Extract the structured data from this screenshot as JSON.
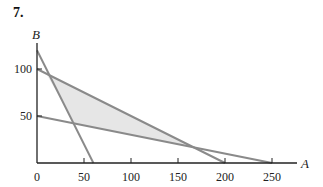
{
  "problem_number": "7.",
  "colors": {
    "line": "#8a8a8a",
    "fill": "#e6e6e6",
    "axis": "#222222"
  },
  "chart_data": {
    "type": "line",
    "title": "",
    "xlabel": "A",
    "ylabel": "B",
    "xlim": [
      0,
      275
    ],
    "ylim": [
      0,
      130
    ],
    "x_ticks": [
      0,
      50,
      100,
      150,
      200,
      250
    ],
    "y_ticks": [
      50,
      100
    ],
    "grid": false,
    "series": [
      {
        "name": "line-1",
        "points": [
          [
            0,
            100
          ],
          [
            200,
            0
          ]
        ]
      },
      {
        "name": "line-2",
        "points": [
          [
            0,
            50
          ],
          [
            250,
            0
          ]
        ]
      },
      {
        "name": "line-3",
        "points": [
          [
            0,
            120
          ],
          [
            60,
            0
          ]
        ]
      }
    ],
    "shaded_region": {
      "vertices": [
        [
          10,
          95
        ],
        [
          40,
          42
        ],
        [
          166.7,
          16.7
        ]
      ],
      "description": "feasible region between lines"
    }
  }
}
